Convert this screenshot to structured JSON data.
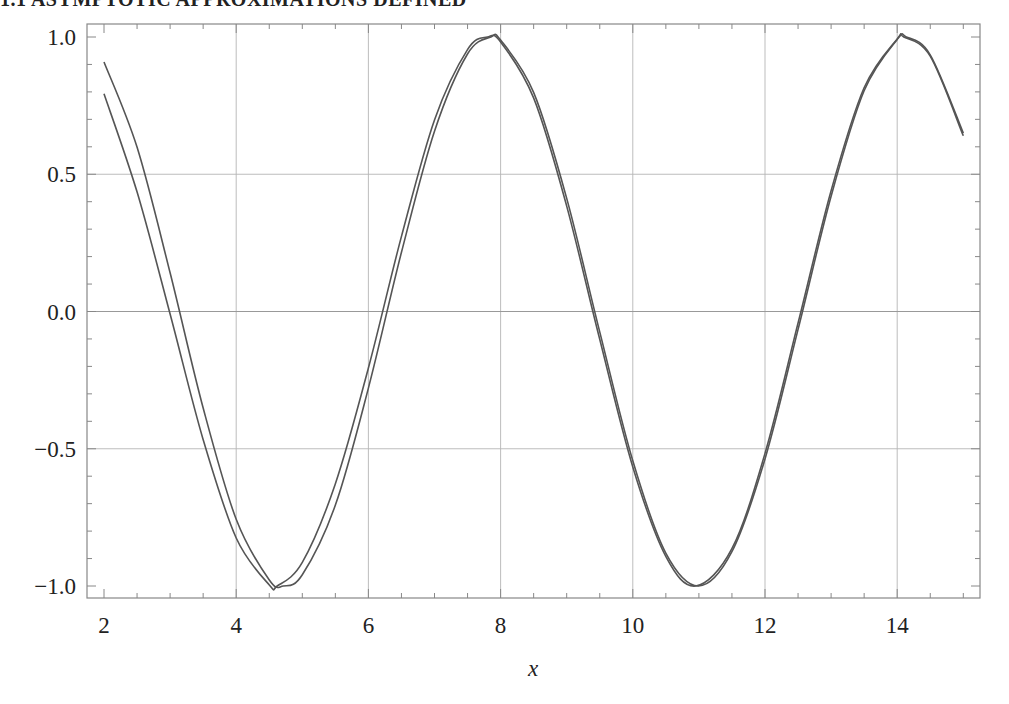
{
  "page": {
    "header_text": "1.1  ASYMPTOTIC APPROXIMATIONS DEFINED"
  },
  "chart_data": {
    "type": "line",
    "title": "",
    "xlabel": "x",
    "ylabel": "",
    "xlim": [
      2,
      15
    ],
    "ylim": [
      -1.0,
      1.0
    ],
    "grid": true,
    "legend": null,
    "x_ticks": [
      2,
      4,
      6,
      8,
      10,
      12,
      14
    ],
    "x_tick_labels": [
      "2",
      "4",
      "6",
      "8",
      "10",
      "12",
      "14"
    ],
    "y_ticks": [
      1.0,
      0.5,
      0.0,
      -0.5,
      -1.0
    ],
    "y_tick_labels": [
      "1.0",
      "0.5",
      "0.0",
      "−0.5",
      "−1.0"
    ],
    "x_gridlines": [
      4,
      6,
      8,
      10,
      12,
      14
    ],
    "y_gridlines": [
      0.5,
      0.0,
      -0.5
    ],
    "series": [
      {
        "name": "curve-upper-start",
        "color": "#555555",
        "x": [
          2.0,
          2.5,
          3.0,
          3.5,
          4.0,
          4.5,
          4.712,
          5.0,
          5.5,
          6.0,
          6.5,
          7.0,
          7.5,
          7.854,
          8.0,
          8.5,
          9.0,
          9.5,
          10.0,
          10.5,
          10.996,
          11.5,
          12.0,
          12.5,
          13.0,
          13.5,
          14.0,
          14.137,
          14.5,
          15.0
        ],
        "values": [
          0.909,
          0.598,
          0.141,
          -0.351,
          -0.757,
          -0.978,
          -1.0,
          -0.959,
          -0.706,
          -0.279,
          0.215,
          0.657,
          0.938,
          1.0,
          0.989,
          0.798,
          0.412,
          -0.075,
          -0.544,
          -0.88,
          -1.0,
          -0.875,
          -0.537,
          -0.066,
          0.42,
          0.804,
          0.991,
          1.0,
          0.935,
          0.65
        ]
      },
      {
        "name": "curve-lower-start",
        "color": "#555555",
        "x": [
          2.0,
          2.5,
          3.0,
          3.5,
          4.0,
          4.5,
          4.62,
          5.0,
          5.5,
          6.0,
          6.5,
          7.0,
          7.5,
          7.8,
          8.0,
          8.5,
          9.0,
          9.5,
          10.0,
          10.5,
          10.95,
          11.5,
          12.0,
          12.5,
          13.0,
          13.5,
          14.0,
          14.1,
          14.5,
          15.0
        ],
        "values": [
          0.793,
          0.435,
          -0.009,
          -0.466,
          -0.825,
          -0.996,
          -1.0,
          -0.914,
          -0.628,
          -0.206,
          0.273,
          0.698,
          0.954,
          1.0,
          0.982,
          0.778,
          0.384,
          -0.102,
          -0.566,
          -0.892,
          -1.0,
          -0.864,
          -0.517,
          -0.043,
          0.44,
          0.815,
          0.993,
          1.0,
          0.93,
          0.64
        ]
      }
    ]
  }
}
